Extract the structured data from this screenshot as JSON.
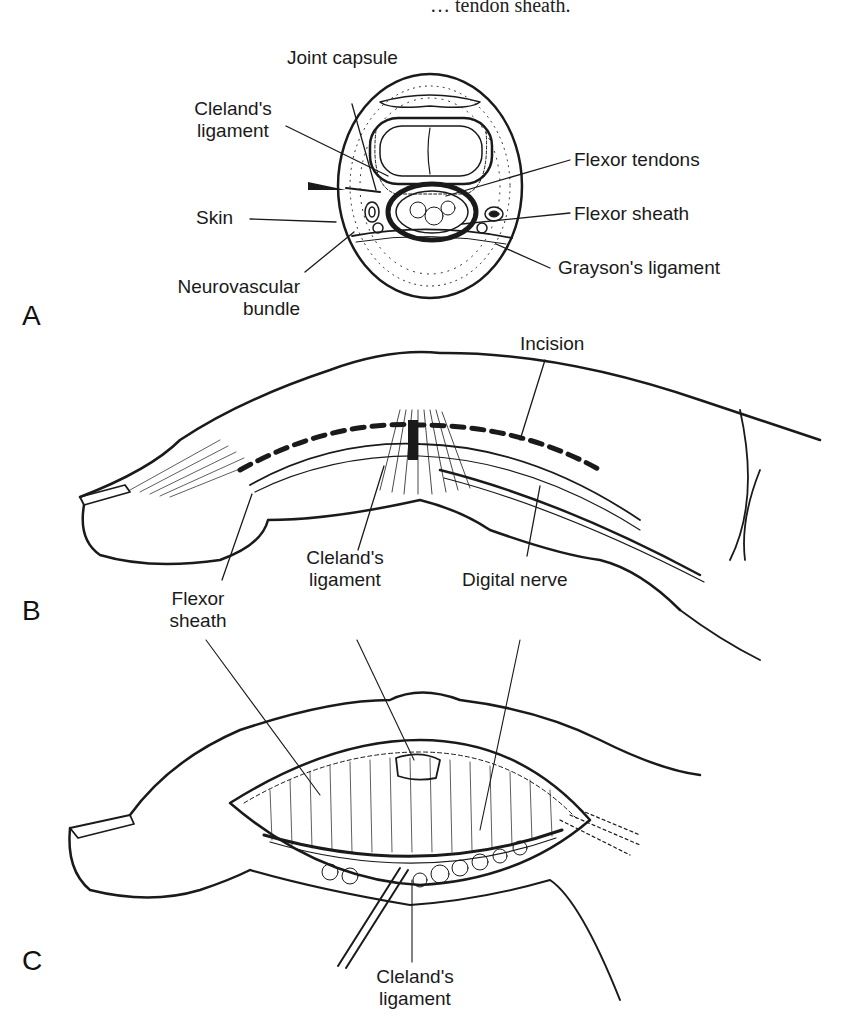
{
  "header": {
    "cut_off_caption": "… tendon sheath."
  },
  "panels": [
    {
      "letter": "A",
      "labels": {
        "joint_capsule": "Joint capsule",
        "clelands_ligament_l1": "Cleland's",
        "clelands_ligament_l2": "ligament",
        "flexor_tendons": "Flexor tendons",
        "skin": "Skin",
        "flexor_sheath": "Flexor sheath",
        "neurovascular_l1": "Neurovascular",
        "neurovascular_l2": "bundle",
        "graysons_ligament": "Grayson's ligament"
      }
    },
    {
      "letter": "B",
      "labels": {
        "incision": "Incision",
        "clelands_ligament_l1": "Cleland's",
        "clelands_ligament_l2": "ligament",
        "digital_nerve": "Digital nerve",
        "flexor_sheath_l1": "Flexor",
        "flexor_sheath_l2": "sheath"
      }
    },
    {
      "letter": "C",
      "labels": {
        "clelands_ligament_l1": "Cleland's",
        "clelands_ligament_l2": "ligament"
      }
    }
  ],
  "colors": {
    "ink": "#1a1a1a",
    "background": "#ffffff"
  }
}
